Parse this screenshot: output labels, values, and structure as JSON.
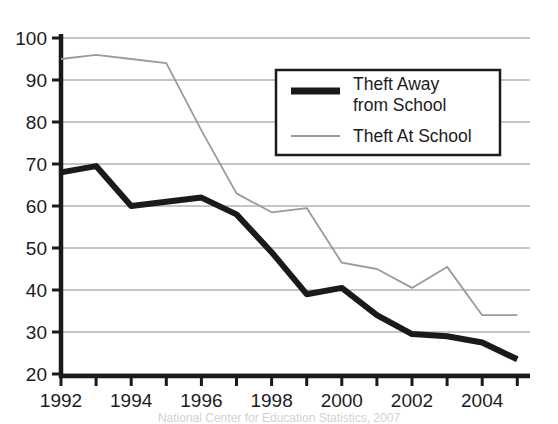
{
  "chart_data": {
    "type": "line",
    "title": "",
    "xlabel": "",
    "ylabel": "",
    "xlim": [
      1992,
      2005
    ],
    "ylim": [
      20,
      100
    ],
    "grid": true,
    "legend_position": "top-right",
    "x": [
      1992,
      1993,
      1994,
      1995,
      1996,
      1997,
      1998,
      1999,
      2000,
      2001,
      2002,
      2003,
      2004,
      2005
    ],
    "xtick_labels": [
      "1992",
      "1994",
      "1996",
      "1998",
      "2000",
      "2002",
      "2004"
    ],
    "xtick_values": [
      1992,
      1994,
      1996,
      1998,
      2000,
      2002,
      2004
    ],
    "ytick_labels": [
      "20",
      "30",
      "40",
      "50",
      "60",
      "70",
      "80",
      "90",
      "100"
    ],
    "ytick_values": [
      20,
      30,
      40,
      50,
      60,
      70,
      80,
      90,
      100
    ],
    "series": [
      {
        "name": "Theft Away from School",
        "color": "#1a1a1a",
        "width": 6,
        "values": [
          68,
          69.5,
          60,
          61,
          62,
          58,
          49,
          39,
          40.5,
          34,
          29.5,
          29,
          27.5,
          23.5
        ]
      },
      {
        "name": "Theft At School",
        "color": "#9a9a9a",
        "width": 1.8,
        "values": [
          95,
          96,
          95,
          94,
          78,
          63,
          58.5,
          59.5,
          46.5,
          45,
          40.5,
          45.5,
          34,
          34
        ]
      }
    ]
  },
  "legend": {
    "items": [
      {
        "label_line1": "Theft Away",
        "label_line2": "from School",
        "swatch": "thick-black-line-swatch"
      },
      {
        "label_line1": "Theft At School",
        "label_line2": "",
        "swatch": "thin-gray-line-swatch"
      }
    ]
  },
  "caption": {
    "text": "National Center for Education Statistics, 2007"
  }
}
